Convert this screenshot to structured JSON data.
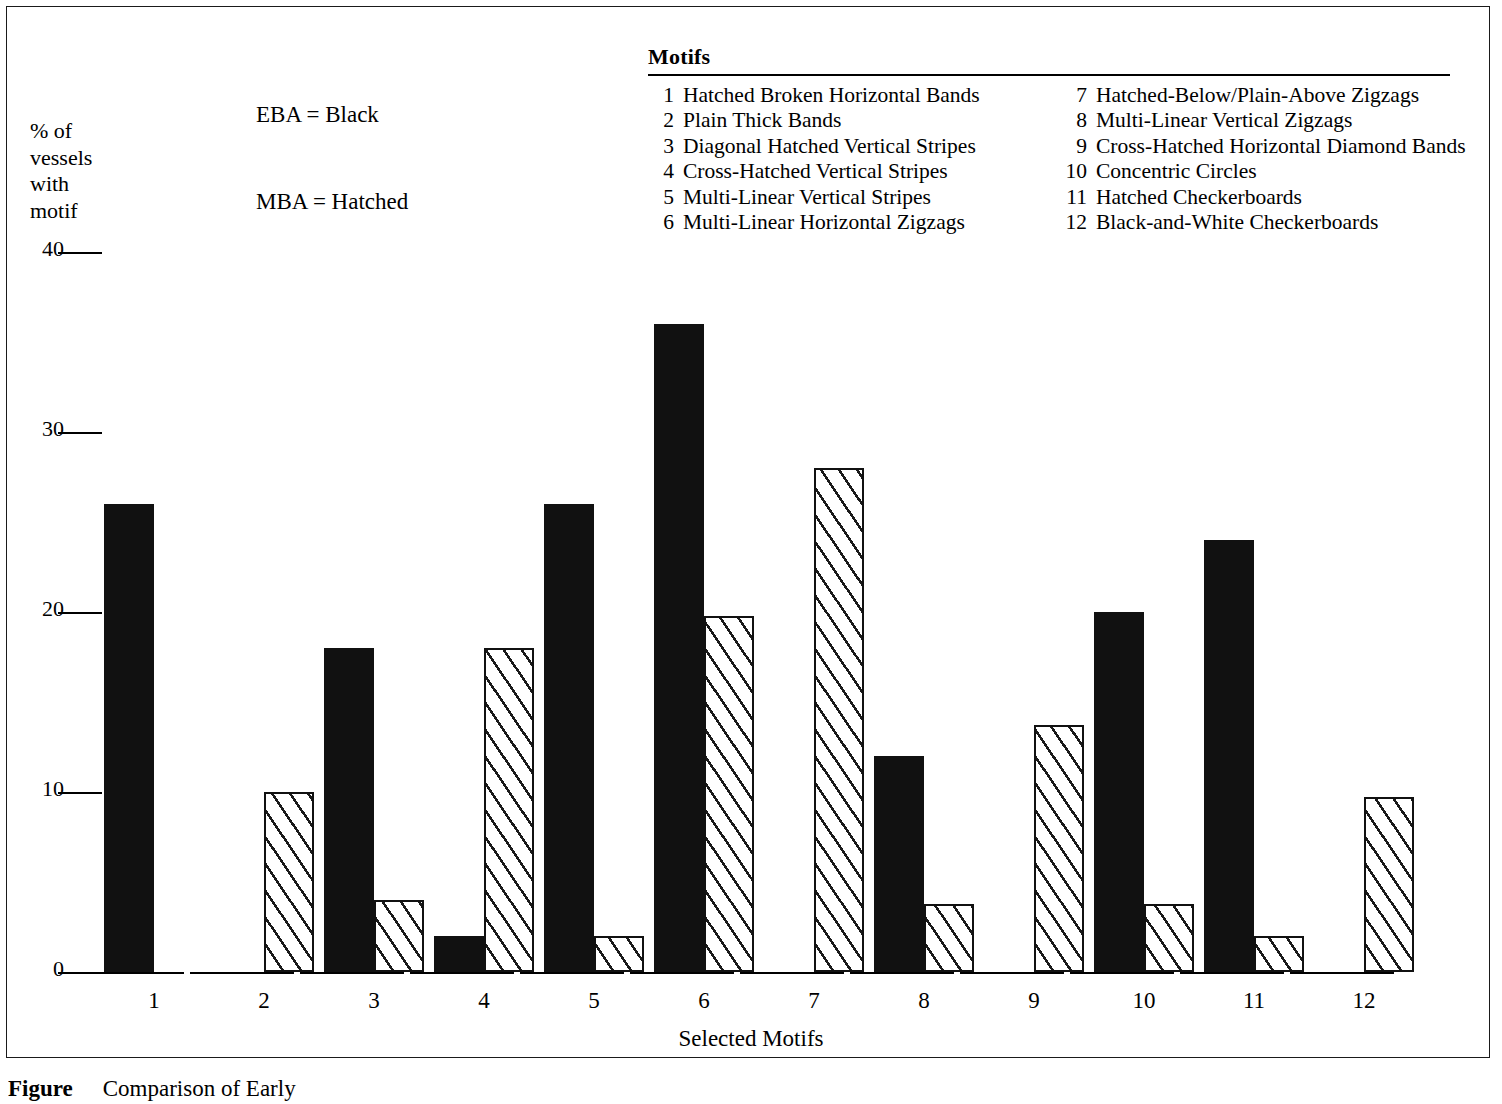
{
  "frame": {
    "border_color": "#1a1a1a"
  },
  "series_key": {
    "line1": "EBA = Black",
    "line2": "MBA = Hatched"
  },
  "motifs_legend": {
    "title": "Motifs",
    "left_column": [
      {
        "num": "1",
        "label": "Hatched Broken Horizontal Bands"
      },
      {
        "num": "2",
        "label": "Plain Thick Bands"
      },
      {
        "num": "3",
        "label": "Diagonal Hatched Vertical Stripes"
      },
      {
        "num": "4",
        "label": "Cross-Hatched Vertical Stripes"
      },
      {
        "num": "5",
        "label": "Multi-Linear Vertical Stripes"
      },
      {
        "num": "6",
        "label": "Multi-Linear Horizontal Zigzags"
      }
    ],
    "right_column": [
      {
        "num": "7",
        "label": "Hatched-Below/Plain-Above Zigzags"
      },
      {
        "num": "8",
        "label": "Multi-Linear Vertical Zigzags"
      },
      {
        "num": "9",
        "label": "Cross-Hatched Horizontal Diamond Bands"
      },
      {
        "num": "10",
        "label": "Concentric Circles"
      },
      {
        "num": "11",
        "label": "Hatched Checkerboards"
      },
      {
        "num": "12",
        "label": "Black-and-White Checkerboards"
      }
    ]
  },
  "ylabel_lines": [
    "% of",
    "vessels",
    "with",
    "motif"
  ],
  "caption": {
    "label": "Figure",
    "text": "Comparison of Early"
  },
  "chart_data": {
    "type": "bar",
    "title": "",
    "xlabel": "Selected Motifs",
    "ylabel": "% of vessels with motif",
    "ylim": [
      0,
      40
    ],
    "yticks": [
      0,
      10,
      20,
      30,
      40
    ],
    "grid": false,
    "legend_position": "top-left",
    "categories": [
      "1",
      "2",
      "3",
      "4",
      "5",
      "6",
      "7",
      "8",
      "9",
      "10",
      "11",
      "12"
    ],
    "series": [
      {
        "name": "EBA",
        "style": "black",
        "color": "#111111",
        "values": [
          26,
          0,
          18,
          2,
          26,
          36,
          0,
          12,
          0,
          20,
          24,
          0
        ]
      },
      {
        "name": "MBA",
        "style": "hatched",
        "color": "#111111",
        "values": [
          0,
          10,
          4,
          18,
          2,
          19.8,
          28,
          3.8,
          13.7,
          3.8,
          2,
          9.7
        ]
      }
    ]
  },
  "layout": {
    "plot_left": 104,
    "plot_baseline_y": 972,
    "plot_top_y": 252,
    "group_width": 110,
    "bar_width": 50,
    "ytick_label_x": 20,
    "ytick_mark_x": 58
  }
}
